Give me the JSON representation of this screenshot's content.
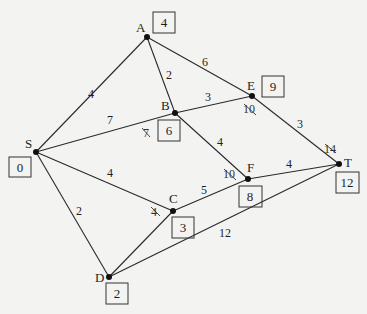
{
  "diagram": {
    "type": "weighted-graph",
    "nodes": [
      {
        "id": "S",
        "label": "S",
        "final_value": "0",
        "x": 36,
        "y": 152,
        "box": {
          "x": 9,
          "y": 158
        }
      },
      {
        "id": "A",
        "label": "A",
        "final_value": "4",
        "x": 147,
        "y": 37,
        "box": {
          "x": 153,
          "y": 12
        }
      },
      {
        "id": "B",
        "label": "B",
        "final_value": "6",
        "x": 175,
        "y": 113,
        "box": {
          "x": 158,
          "y": 120
        }
      },
      {
        "id": "E",
        "label": "E",
        "final_value": "9",
        "x": 252,
        "y": 96,
        "box": {
          "x": 262,
          "y": 76
        }
      },
      {
        "id": "C",
        "label": "C",
        "final_value": "3",
        "x": 173,
        "y": 211,
        "box": {
          "x": 172,
          "y": 217
        }
      },
      {
        "id": "F",
        "label": "F",
        "final_value": "8",
        "x": 248,
        "y": 179,
        "box": {
          "x": 239,
          "y": 186
        }
      },
      {
        "id": "T",
        "label": "T",
        "final_value": "12",
        "x": 339,
        "y": 164,
        "box": {
          "x": 336,
          "y": 172
        }
      },
      {
        "id": "D",
        "label": "D",
        "final_value": "2",
        "x": 109,
        "y": 277,
        "box": {
          "x": 106,
          "y": 283
        }
      }
    ],
    "edges": [
      {
        "from": "S",
        "to": "A",
        "weight": "4"
      },
      {
        "from": "S",
        "to": "B",
        "weight": "7"
      },
      {
        "from": "S",
        "to": "C",
        "weight": "4"
      },
      {
        "from": "S",
        "to": "D",
        "weight": "2"
      },
      {
        "from": "A",
        "to": "B",
        "weight": "2"
      },
      {
        "from": "A",
        "to": "E",
        "weight": "6"
      },
      {
        "from": "B",
        "to": "E",
        "weight": "3"
      },
      {
        "from": "B",
        "to": "F",
        "weight": "4"
      },
      {
        "from": "E",
        "to": "T",
        "weight": "3"
      },
      {
        "from": "C",
        "to": "F",
        "weight": "5"
      },
      {
        "from": "C",
        "to": "D",
        "weight": ""
      },
      {
        "from": "F",
        "to": "T",
        "weight": "4"
      },
      {
        "from": "D",
        "to": "T",
        "weight": "12"
      }
    ],
    "crossed_out_temporary_labels": [
      {
        "node": "B",
        "value": "7"
      },
      {
        "node": "E",
        "value": "10"
      },
      {
        "node": "T",
        "value": "14"
      },
      {
        "node": "F",
        "value": "10"
      },
      {
        "node": "C",
        "value": "4"
      }
    ]
  },
  "labels": {
    "S": "S",
    "A": "A",
    "B": "B",
    "E": "E",
    "C": "C",
    "F": "F",
    "T": "T",
    "D": "D"
  },
  "boxes": {
    "S": "0",
    "A": "4",
    "B": "6",
    "E": "9",
    "C": "3",
    "F": "8",
    "T": "12",
    "D": "2"
  },
  "weights": {
    "SA": "4",
    "SB": "7",
    "SC": "4",
    "SD": "2",
    "AB": "2",
    "AE": "6",
    "BE": "3",
    "BF": "4",
    "ET": "3",
    "CF": "5",
    "FT": "4",
    "DT": "12"
  },
  "strikes": {
    "B": "7",
    "E": "10",
    "T": "14",
    "F": "10",
    "C": "4"
  }
}
